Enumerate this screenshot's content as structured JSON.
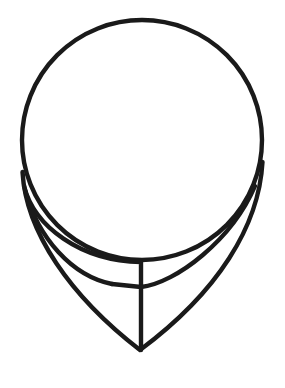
{
  "canvas": {
    "width": 285,
    "height": 388,
    "background_color": "#ffffff"
  },
  "artwork": {
    "name": "speech-bubble-outline",
    "title": "Speech Bubble",
    "style": "line-art",
    "stroke_color": "#1a1a1a",
    "stroke_width": 4.4,
    "fill": "none",
    "element_count": 3
  },
  "geometry": {
    "circle": {
      "name": "bubble-body",
      "center_x": 142,
      "center_y": 140,
      "radius": 120
    },
    "outer_tail": {
      "name": "bubble-tail-outer",
      "start_x": 22.5,
      "start_y": 172,
      "tip_x": 140,
      "tip_y": 350,
      "end_x": 262.5,
      "end_y": 162,
      "path": "M 22.5 172 C 26 232 70 296 140 350 C 218 292 259 226 262.5 162"
    },
    "inner_tail": {
      "name": "bubble-tail-inner",
      "start_x": 24,
      "start_y": 186,
      "corner_top_x": 141,
      "corner_top_y": 262,
      "corner_bottom_y": 287,
      "tip_x": 140,
      "tip_y": 350,
      "path": "M 24 186 C 34 226 80 261 141 262 L 141 350"
    },
    "inner_sweep": {
      "name": "bubble-tail-inner-sweep",
      "path": "M 141 287 C 176 283 232 240 255 186"
    }
  }
}
